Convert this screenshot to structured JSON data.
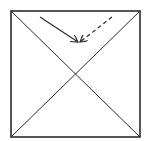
{
  "diagram": {
    "colors": {
      "stroke": "#2b2b2b",
      "background": "#ffffff"
    },
    "square": {
      "x1": 11,
      "y1": 11,
      "x2": 140,
      "y2": 137
    },
    "arrows": [
      {
        "style": "solid",
        "from": [
          40,
          17
        ],
        "to": [
          78,
          42
        ]
      },
      {
        "style": "dashed",
        "from": [
          112,
          17
        ],
        "to": [
          80,
          42
        ]
      }
    ]
  }
}
